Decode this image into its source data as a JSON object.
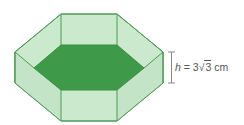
{
  "figure": {
    "colors": {
      "face": "#c9e8cc",
      "face_dark": "#b6dcb9",
      "base": "#3e9a48",
      "edge": "#4e9a56",
      "dimension_line": "#888888"
    }
  },
  "label": {
    "variable": "h",
    "equals": "=",
    "coefficient": "3",
    "radical_symbol": "√",
    "radicand": "3",
    "unit": "cm"
  }
}
